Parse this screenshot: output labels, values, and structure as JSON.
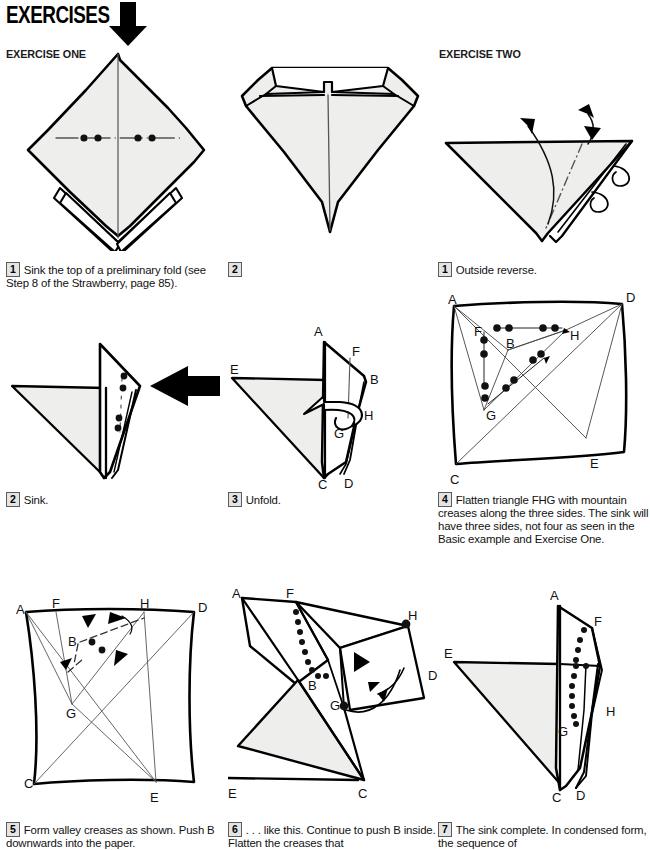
{
  "page": {
    "section_title": "EXERCISES",
    "paper_color": "#eeeeec",
    "ink_color": "#000000",
    "crease_color": "#555555"
  },
  "headers": {
    "exercise_one": "EXERCISE ONE",
    "exercise_two": "EXERCISE TWO"
  },
  "steps": [
    {
      "id": "ex1-step1",
      "number": "1",
      "text": "Sink the top of a preliminary fold (see Step 8 of the Strawberry, page 85).",
      "figure_name": "preliminary-fold-diamond"
    },
    {
      "id": "ex1-step2",
      "number": "2",
      "text": "",
      "figure_name": "sunk-top-diamond"
    },
    {
      "id": "ex2-step1",
      "number": "1",
      "text": "Outside reverse.",
      "figure_name": "outside-reverse-triangle"
    },
    {
      "id": "ex1-step2b",
      "number": "2",
      "text": "Sink.",
      "figure_name": "side-view-sink"
    },
    {
      "id": "ex1-step3",
      "number": "3",
      "text": "Unfold.",
      "figure_name": "unfold-side-view"
    },
    {
      "id": "ex2-step4",
      "number": "4",
      "text": "Flatten triangle FHG with mountain creases along the three sides. The sink will have three sides, not four as seen in the Basic example and Exercise One.",
      "figure_name": "crease-pattern-square"
    },
    {
      "id": "ex2-step5",
      "number": "5",
      "text": "Form valley creases as shown. Push B downwards into the paper.",
      "figure_name": "valley-creases-square"
    },
    {
      "id": "ex2-step6",
      "number": "6",
      "text": ". . . like this. Continue to push B inside. Flatten the creases that",
      "figure_name": "pushing-b-inside"
    },
    {
      "id": "ex2-step7",
      "number": "7",
      "text": "The sink complete. In condensed form, the sequence of",
      "figure_name": "sink-complete"
    }
  ],
  "figure_labels": {
    "unfold_side_view": [
      "A",
      "F",
      "B",
      "E",
      "H",
      "G",
      "C",
      "D"
    ],
    "crease_pattern_square": [
      "A",
      "D",
      "F",
      "B",
      "H",
      "G",
      "C",
      "E"
    ],
    "valley_creases_square": [
      "A",
      "F",
      "H",
      "D",
      "B",
      "G",
      "C",
      "E"
    ],
    "pushing_b_inside": [
      "A",
      "F",
      "H",
      "B",
      "G",
      "D",
      "E",
      "C"
    ],
    "sink_complete": [
      "A",
      "F",
      "E",
      "H",
      "G",
      "C",
      "D"
    ]
  },
  "symbols": {
    "push_arrow": "solid-black-arrow",
    "mountain_crease": "dash-dot-line",
    "valley_crease": "dashed-line",
    "turn_arrow": "hollow-curved-arrow",
    "dotted_crease": "dotted-line"
  }
}
